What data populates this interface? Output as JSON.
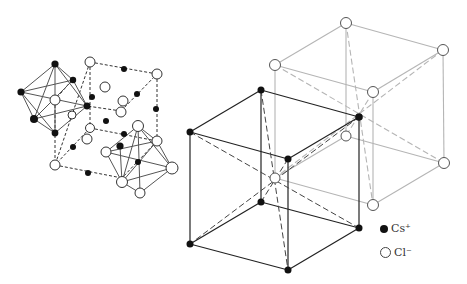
{
  "legend": {
    "items": [
      {
        "label": "Cs⁺",
        "symbol": "filled-black-circle",
        "color": "#111111"
      },
      {
        "label": "Cl⁻",
        "symbol": "open-circle",
        "color": "#ffffff"
      }
    ]
  },
  "colors": {
    "primary": "#222222",
    "secondary": "#bbbbbb",
    "background": "#ffffff"
  }
}
